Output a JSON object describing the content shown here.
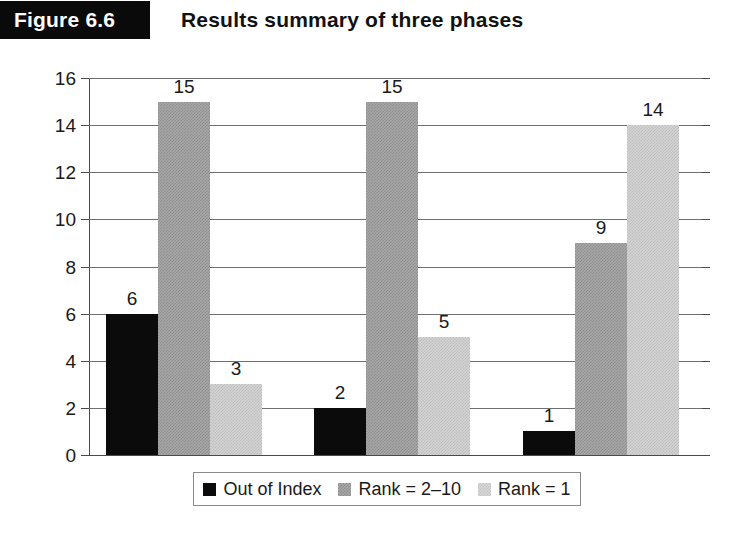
{
  "header": {
    "figure_tag": "Figure 6.6",
    "title": "Results summary of three phases"
  },
  "chart_data": {
    "type": "bar",
    "title": "Results summary of three phases",
    "xlabel": "",
    "ylabel": "",
    "ylim": [
      0,
      16
    ],
    "yticks": [
      0,
      2,
      4,
      6,
      8,
      10,
      12,
      14,
      16
    ],
    "grid": true,
    "legend_position": "bottom",
    "categories": [
      "Phase 1",
      "Phase 2",
      "Phase 3"
    ],
    "series": [
      {
        "name": "Out of Index",
        "color": "#0b0b0b",
        "values": [
          6,
          2,
          1
        ]
      },
      {
        "name": "Rank = 2–10",
        "color": "#a8a8a8",
        "values": [
          15,
          15,
          9
        ]
      },
      {
        "name": "Rank = 1",
        "color": "#d4d4d4",
        "values": [
          3,
          5,
          14
        ]
      }
    ],
    "data_labels": [
      [
        "6",
        "15",
        "3"
      ],
      [
        "2",
        "15",
        "5"
      ],
      [
        "1",
        "9",
        "14"
      ]
    ]
  },
  "legend": {
    "items": [
      {
        "label": "Out of Index",
        "swatch": "black-square-icon"
      },
      {
        "label": "Rank = 2–10",
        "swatch": "medium-gray-square-icon"
      },
      {
        "label": "Rank = 1",
        "swatch": "light-gray-square-icon"
      }
    ]
  },
  "axis": {
    "y_tick_labels": [
      "16",
      "14",
      "12",
      "10",
      "8",
      "6",
      "4",
      "2",
      "0"
    ]
  }
}
